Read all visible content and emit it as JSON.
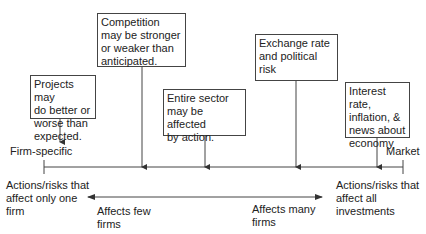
{
  "diagram": {
    "boxes": [
      {
        "id": "projects",
        "text": "Projects may\ndo better or\nworse than\nexpected."
      },
      {
        "id": "competition",
        "text": "Competition\nmay be stronger\nor weaker than\nanticipated."
      },
      {
        "id": "sector",
        "text": "Entire sector\nmay be affected\nby action."
      },
      {
        "id": "exchange",
        "text": "Exchange rate\nand political\nrisk"
      },
      {
        "id": "interest",
        "text": "Interest rate,\ninflation, &\nnews about\neconomy"
      }
    ],
    "axis": {
      "left_label": "Firm-specific",
      "right_label": "Market"
    },
    "bottom": {
      "left_text": "Actions/risks that\naffect only one\nfirm",
      "right_text": "Actions/risks that\naffect all\ninvestments",
      "few_label": "Affects few\nfirms",
      "many_label": "Affects many\nfirms"
    },
    "colors": {
      "line": "#444444",
      "text": "#222222",
      "background": "#ffffff"
    }
  }
}
